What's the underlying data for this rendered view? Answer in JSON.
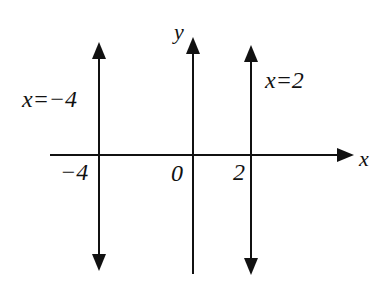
{
  "diagram": {
    "type": "coordinate-plane-vertical-lines",
    "colors": {
      "background": "#ffffff",
      "ink": "#111111"
    },
    "axes": {
      "x_label": "x",
      "y_label": "y",
      "origin_label": "0"
    },
    "ticks": [
      {
        "value": -4,
        "label": "−4"
      },
      {
        "value": 0,
        "label": "0"
      },
      {
        "value": 2,
        "label": "2"
      }
    ],
    "lines": [
      {
        "equation": "x=−4",
        "x": -4,
        "label": "x=−4"
      },
      {
        "equation": "x=2",
        "x": 2,
        "label": "x=2"
      }
    ],
    "labels": {
      "line_left": "x=−4",
      "line_right": "x=2",
      "tick_neg4": "−4",
      "tick_0": "0",
      "tick_2": "2",
      "x_axis": "x",
      "y_axis": "y"
    }
  }
}
